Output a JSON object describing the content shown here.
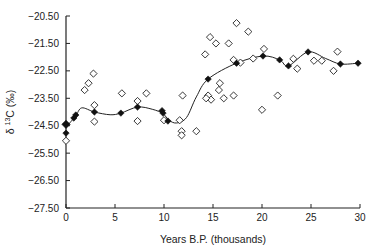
{
  "chart_data": {
    "type": "scatter",
    "title": "",
    "xlabel": "Years  B.P. (thousands)",
    "ylabel": "δ ¹³C (‰)",
    "ylabel_parts": {
      "prefix": "δ ",
      "sup": "13",
      "suffix": "C (‰)"
    },
    "xlim": [
      0,
      30
    ],
    "ylim": [
      -27.5,
      -20.5
    ],
    "x_ticks": [
      0,
      5,
      10,
      15,
      20,
      25,
      30
    ],
    "x_tick_labels": [
      "0",
      "5",
      "10",
      "15",
      "20",
      "25",
      "30"
    ],
    "y_ticks": [
      -20.5,
      -21.5,
      -22.5,
      -23.5,
      -24.5,
      -25.5,
      -26.5,
      -27.5
    ],
    "y_tick_labels": [
      "-20.50",
      "-21.50",
      "-22.50",
      "-23.50",
      "-24.50",
      "-25.50",
      "-26.50",
      "-27.50"
    ],
    "grid": false,
    "series": [
      {
        "name": "individual samples",
        "marker": "open-diamond",
        "points": [
          [
            0.0,
            -25.05
          ],
          [
            1.9,
            -23.2
          ],
          [
            2.3,
            -22.95
          ],
          [
            2.8,
            -22.6
          ],
          [
            2.9,
            -23.75
          ],
          [
            2.9,
            -24.35
          ],
          [
            5.7,
            -23.32
          ],
          [
            8.2,
            -23.32
          ],
          [
            7.3,
            -23.6
          ],
          [
            7.3,
            -24.33
          ],
          [
            10.0,
            -24.3
          ],
          [
            11.6,
            -24.3
          ],
          [
            11.8,
            -24.7
          ],
          [
            11.8,
            -24.85
          ],
          [
            13.3,
            -24.7
          ],
          [
            11.9,
            -23.4
          ],
          [
            14.5,
            -23.4
          ],
          [
            14.8,
            -23.55
          ],
          [
            14.2,
            -21.9
          ],
          [
            14.7,
            -21.27
          ],
          [
            15.3,
            -21.5
          ],
          [
            16.6,
            -21.5
          ],
          [
            17.4,
            -20.76
          ],
          [
            18.6,
            -21.07
          ],
          [
            17.1,
            -22.1
          ],
          [
            17.8,
            -22.2
          ],
          [
            19.1,
            -22.05
          ],
          [
            20.2,
            -21.7
          ],
          [
            15.7,
            -22.95
          ],
          [
            15.6,
            -23.2
          ],
          [
            14.3,
            -23.5
          ],
          [
            16.1,
            -23.5
          ],
          [
            17.1,
            -23.4
          ],
          [
            20.0,
            -23.92
          ],
          [
            21.6,
            -23.4
          ],
          [
            23.2,
            -22.06
          ],
          [
            23.6,
            -22.42
          ],
          [
            25.3,
            -22.13
          ],
          [
            26.1,
            -22.13
          ],
          [
            27.3,
            -22.5
          ],
          [
            27.7,
            -21.8
          ]
        ]
      },
      {
        "name": "mean values",
        "marker": "filled-diamond",
        "points": [
          [
            0.0,
            -24.45
          ],
          [
            0.0,
            -24.77
          ],
          [
            0.8,
            -24.22
          ],
          [
            1.0,
            -24.11
          ],
          [
            2.9,
            -24.0
          ],
          [
            5.6,
            -24.04
          ],
          [
            7.3,
            -23.82
          ],
          [
            9.8,
            -23.95
          ],
          [
            9.9,
            -24.04
          ],
          [
            10.4,
            -24.33
          ],
          [
            14.5,
            -22.8
          ],
          [
            17.4,
            -22.22
          ],
          [
            20.1,
            -21.96
          ],
          [
            21.8,
            -22.1
          ],
          [
            22.7,
            -22.32
          ],
          [
            24.7,
            -21.81
          ],
          [
            28.0,
            -22.25
          ],
          [
            29.8,
            -22.22
          ]
        ]
      },
      {
        "name": "smoothed trend",
        "type": "line",
        "points": [
          [
            0.0,
            -24.55
          ],
          [
            0.5,
            -24.35
          ],
          [
            1.0,
            -24.15
          ],
          [
            1.6,
            -23.85
          ],
          [
            2.9,
            -24.0
          ],
          [
            4.5,
            -24.1
          ],
          [
            5.6,
            -24.04
          ],
          [
            7.3,
            -23.82
          ],
          [
            8.8,
            -23.9
          ],
          [
            9.9,
            -24.06
          ],
          [
            10.5,
            -24.3
          ],
          [
            11.3,
            -24.4
          ],
          [
            12.3,
            -24.2
          ],
          [
            13.3,
            -23.45
          ],
          [
            14.5,
            -22.8
          ],
          [
            17.4,
            -22.22
          ],
          [
            20.1,
            -21.96
          ],
          [
            21.8,
            -22.1
          ],
          [
            22.7,
            -22.32
          ],
          [
            24.7,
            -21.81
          ],
          [
            26.5,
            -22.05
          ],
          [
            28.0,
            -22.25
          ],
          [
            29.8,
            -22.22
          ]
        ]
      }
    ]
  }
}
